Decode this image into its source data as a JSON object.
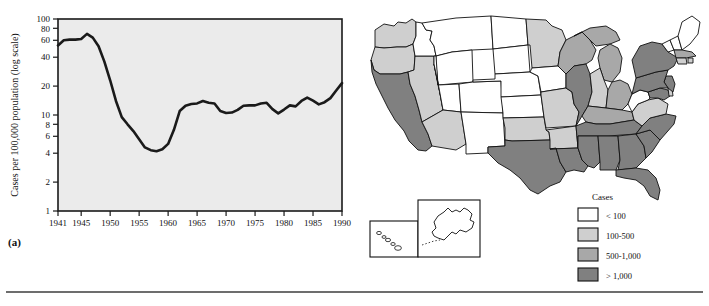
{
  "figure": {
    "panel_a_label": "(a)",
    "panel_b_label": "(b)"
  },
  "chart_data": [
    {
      "id": "panel-a",
      "type": "line",
      "title": "",
      "xlabel": "",
      "ylabel": "Cases per 100,000 population (log scale)",
      "yscale": "log",
      "ylim": [
        1,
        100
      ],
      "xlim": [
        1941,
        1990
      ],
      "grid": false,
      "legend": "none",
      "plot_background": "#ebebeb",
      "line_color": "#1a1a1a",
      "ytick_labels": [
        "100",
        "80",
        "60",
        "40",
        "20",
        "10",
        "8",
        "6",
        "4",
        "2",
        "1"
      ],
      "yticks": [
        100,
        80,
        60,
        40,
        20,
        10,
        8,
        6,
        4,
        2,
        1
      ],
      "xtick_labels": [
        "1941",
        "1945",
        "1950",
        "1955",
        "1960",
        "1965",
        "1970",
        "1975",
        "1980",
        "1985",
        "1990"
      ],
      "xticks": [
        1941,
        1945,
        1950,
        1955,
        1960,
        1965,
        1970,
        1975,
        1980,
        1985,
        1990
      ],
      "x": [
        1941,
        1942,
        1943,
        1944,
        1945,
        1946,
        1947,
        1948,
        1949,
        1950,
        1951,
        1952,
        1953,
        1954,
        1955,
        1956,
        1957,
        1958,
        1959,
        1960,
        1961,
        1962,
        1963,
        1964,
        1965,
        1966,
        1967,
        1968,
        1969,
        1970,
        1971,
        1972,
        1973,
        1974,
        1975,
        1976,
        1977,
        1978,
        1979,
        1980,
        1981,
        1982,
        1983,
        1984,
        1985,
        1986,
        1987,
        1988,
        1989,
        1990
      ],
      "values": [
        53,
        60,
        61,
        61,
        62,
        70,
        64,
        52,
        36,
        23,
        14,
        9.5,
        8,
        6.8,
        5.6,
        4.6,
        4.3,
        4.2,
        4.4,
        5.0,
        7.0,
        11,
        12.5,
        13,
        13.2,
        14,
        13.4,
        13.2,
        11.0,
        10.5,
        10.6,
        11.3,
        12.5,
        12.6,
        12.6,
        13.2,
        13.4,
        11.5,
        10.4,
        11.4,
        12.6,
        12.3,
        14.0,
        15.2,
        14.1,
        12.9,
        13.6,
        15.0,
        18.0,
        21.5
      ]
    },
    {
      "id": "panel-b",
      "type": "choropleth",
      "title": "",
      "legend_title": "Cases",
      "legend_position": "bottom-right",
      "legend_items": [
        {
          "label": "< 100",
          "color": "#ffffff"
        },
        {
          "label": "100-500",
          "color": "#cfcfcf"
        },
        {
          "label": "500-1,000",
          "color": "#a8a8a8"
        },
        {
          "label": "> 1,000",
          "color": "#808080"
        }
      ],
      "inset_regions": [
        "HI",
        "AK"
      ],
      "categories": [
        "< 100",
        "100-500",
        "500-1,000",
        "> 1,000"
      ],
      "regions": [
        {
          "code": "WA",
          "class": "100-500"
        },
        {
          "code": "OR",
          "class": "100-500"
        },
        {
          "code": "CA",
          "class": "> 1,000"
        },
        {
          "code": "NV",
          "class": "100-500"
        },
        {
          "code": "ID",
          "class": "< 100"
        },
        {
          "code": "MT",
          "class": "< 100"
        },
        {
          "code": "WY",
          "class": "< 100"
        },
        {
          "code": "UT",
          "class": "< 100"
        },
        {
          "code": "AZ",
          "class": "100-500"
        },
        {
          "code": "NM",
          "class": "< 100"
        },
        {
          "code": "CO",
          "class": "< 100"
        },
        {
          "code": "ND",
          "class": "< 100"
        },
        {
          "code": "SD",
          "class": "< 100"
        },
        {
          "code": "NE",
          "class": "< 100"
        },
        {
          "code": "KS",
          "class": "< 100"
        },
        {
          "code": "OK",
          "class": "100-500"
        },
        {
          "code": "TX",
          "class": "> 1,000"
        },
        {
          "code": "MN",
          "class": "100-500"
        },
        {
          "code": "IA",
          "class": "< 100"
        },
        {
          "code": "MO",
          "class": "100-500"
        },
        {
          "code": "AR",
          "class": "100-500"
        },
        {
          "code": "LA",
          "class": "> 1,000"
        },
        {
          "code": "WI",
          "class": "500-1,000"
        },
        {
          "code": "IL",
          "class": "> 1,000"
        },
        {
          "code": "MI",
          "class": "500-1,000"
        },
        {
          "code": "IN",
          "class": "100-500"
        },
        {
          "code": "OH",
          "class": "500-1,000"
        },
        {
          "code": "KY",
          "class": "500-1,000"
        },
        {
          "code": "TN",
          "class": "> 1,000"
        },
        {
          "code": "MS",
          "class": "> 1,000"
        },
        {
          "code": "AL",
          "class": "> 1,000"
        },
        {
          "code": "GA",
          "class": "> 1,000"
        },
        {
          "code": "FL",
          "class": "> 1,000"
        },
        {
          "code": "SC",
          "class": "> 1,000"
        },
        {
          "code": "NC",
          "class": "> 1,000"
        },
        {
          "code": "VA",
          "class": "100-500"
        },
        {
          "code": "WV",
          "class": "< 100"
        },
        {
          "code": "MD",
          "class": "> 1,000"
        },
        {
          "code": "DE",
          "class": "100-500"
        },
        {
          "code": "NJ",
          "class": "> 1,000"
        },
        {
          "code": "PA",
          "class": "> 1,000"
        },
        {
          "code": "NY",
          "class": "> 1,000"
        },
        {
          "code": "CT",
          "class": "100-500"
        },
        {
          "code": "RI",
          "class": "100-500"
        },
        {
          "code": "MA",
          "class": "500-1,000"
        },
        {
          "code": "VT",
          "class": "< 100"
        },
        {
          "code": "NH",
          "class": "< 100"
        },
        {
          "code": "ME",
          "class": "< 100"
        },
        {
          "code": "AK",
          "class": "< 100"
        },
        {
          "code": "HI",
          "class": "< 100"
        }
      ]
    }
  ]
}
